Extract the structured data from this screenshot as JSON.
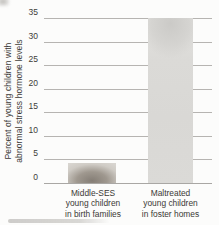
{
  "chart_data": {
    "type": "bar",
    "title": "",
    "ylabel": "Percent of young children with abnormal stress hormone levels",
    "ylabel_lines": [
      "Percent of young children with",
      "abnormal stress hormone levels"
    ],
    "yticks": [
      0,
      5,
      10,
      15,
      20,
      25,
      30,
      35
    ],
    "ylim": [
      0,
      35
    ],
    "grid": true,
    "legend": "none",
    "categories": [
      "Middle-SES young children in birth families",
      "Maltreated young children in foster homes"
    ],
    "series": [
      {
        "name": "Percent of young children with abnormal stress hormone levels",
        "values": [
          4.3,
          35
        ]
      }
    ],
    "bars": [
      {
        "label_lines": [
          "Middle-SES",
          "young children",
          "in birth families"
        ],
        "value": 4.3
      },
      {
        "label_lines": [
          "Maltreated",
          "young children",
          "in foster homes"
        ],
        "value": 35
      }
    ]
  },
  "colors": {
    "background": "#fcfcfb",
    "gridline": "#b6b4b1",
    "baseline": "#a9a7a4",
    "tick_text": "#3e3c39",
    "label_text": "#3b3936",
    "bar_small_dark": "#857e76",
    "bar_small_mid": "#9f988f",
    "bar_small_edge": "#cfcbc5",
    "bar_small_corner": "#d8d5d0",
    "bar_tall_shade": "#cbcac7",
    "bar_tall_light": "#e3e2df",
    "bar_tall_body": "#dbdad7"
  }
}
